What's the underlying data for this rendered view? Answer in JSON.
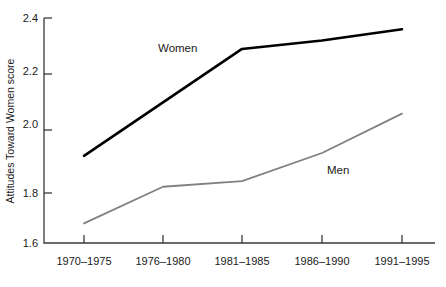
{
  "chart_data": {
    "type": "line",
    "title": "",
    "xlabel": "",
    "ylabel": "Attitudes Toward Women score",
    "categories": [
      "1970–1975",
      "1976–1980",
      "1981–1985",
      "1986–1990",
      "1991–1995"
    ],
    "ylim": [
      1.6,
      2.4
    ],
    "yticks": [
      "1.6",
      "1.8",
      "2.0",
      "2.2",
      "2.4"
    ],
    "ytick_values": [
      1.6,
      1.8,
      2.0,
      2.2,
      2.4
    ],
    "grid": false,
    "legend_position": "inline-labels",
    "series": [
      {
        "name": "Women",
        "values": [
          1.91,
          2.1,
          2.29,
          2.32,
          2.36
        ],
        "color": "#000000",
        "line_width": 2.6,
        "label": "Women"
      },
      {
        "name": "Men",
        "values": [
          1.67,
          1.8,
          1.82,
          1.92,
          2.06
        ],
        "color": "#808080",
        "line_width": 1.8,
        "label": "Men"
      }
    ],
    "annotations": [
      {
        "text": "Women",
        "series": "Women",
        "x_px": 158,
        "y_px": 52
      },
      {
        "text": "Men",
        "series": "Men",
        "x_px": 327,
        "y_px": 174
      }
    ]
  },
  "axes": {
    "spine_color": "#3a3a3a",
    "tick_color": "#3a3a3a"
  }
}
